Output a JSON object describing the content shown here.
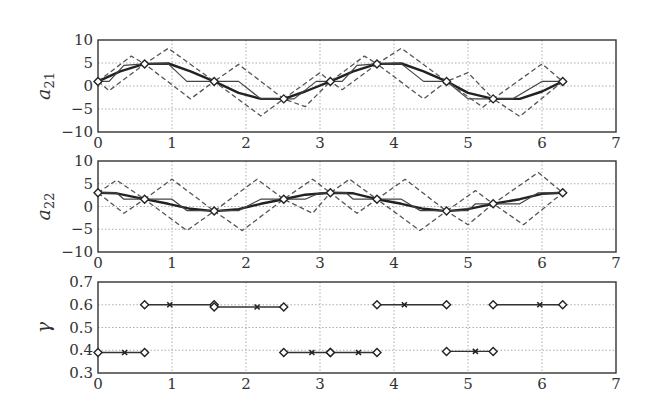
{
  "chart_data": [
    {
      "type": "line",
      "panel": "top",
      "ylabel": "a_21",
      "ylabel_main": "a",
      "ylabel_sub": "21",
      "xlim": [
        0,
        7
      ],
      "ylim": [
        -10,
        10
      ],
      "xticks": [
        "0",
        "1",
        "2",
        "3",
        "4",
        "5",
        "6",
        "7"
      ],
      "yticks": [
        "10",
        "5",
        "0",
        "−5",
        "−10"
      ],
      "grid": true,
      "series": [
        {
          "name": "smooth (thick)",
          "style": "solid-thick",
          "x": [
            0,
            0.3,
            0.63,
            0.95,
            1.25,
            1.57,
            1.9,
            2.2,
            2.51,
            2.8,
            3.14,
            3.45,
            3.77,
            4.1,
            4.4,
            4.71,
            5.0,
            5.34,
            5.7,
            6.0,
            6.28
          ],
          "y": [
            1,
            3.2,
            4.8,
            4.9,
            3.2,
            1,
            -1.5,
            -2.8,
            -2.8,
            -1.2,
            1,
            3.2,
            4.8,
            4.9,
            3.2,
            1,
            -1.5,
            -2.8,
            -2.8,
            -1.2,
            1
          ]
        },
        {
          "name": "piecewise (thin)",
          "style": "solid-thin",
          "x": [
            0,
            0.15,
            0.35,
            0.63,
            0.95,
            1.2,
            1.57,
            1.9,
            2.2,
            2.51,
            2.65,
            2.95,
            3.14,
            3.3,
            3.5,
            3.77,
            4.1,
            4.4,
            4.71,
            5.0,
            5.2,
            5.34,
            5.6,
            6.0,
            6.28
          ],
          "y": [
            1,
            1,
            4.5,
            4.8,
            4.8,
            1,
            1,
            1,
            -2.8,
            -2.8,
            -2.8,
            1,
            1,
            1,
            4.5,
            4.8,
            4.8,
            1,
            1,
            -2.8,
            -2.8,
            -2.8,
            -2.8,
            1,
            1
          ]
        },
        {
          "name": "upper bound (dashed)",
          "style": "dashed",
          "x": [
            0,
            0.45,
            0.63,
            0.95,
            1.57,
            1.9,
            2.51,
            2.8,
            3.14,
            3.6,
            3.77,
            4.1,
            4.71,
            5.0,
            5.34,
            6.0,
            6.28
          ],
          "y": [
            1,
            6.5,
            4.8,
            8.2,
            1,
            4.7,
            -2.8,
            -4.5,
            1,
            6.5,
            4.8,
            8.2,
            1,
            2.9,
            -2.8,
            4.8,
            1
          ]
        },
        {
          "name": "lower bound (dashed)",
          "style": "dashed",
          "x": [
            0,
            0.15,
            0.63,
            1.25,
            1.57,
            2.2,
            2.51,
            3.0,
            3.14,
            3.3,
            3.77,
            4.4,
            4.71,
            5.2,
            5.34,
            5.7,
            6.28
          ],
          "y": [
            1,
            -1,
            4.8,
            -2.8,
            1,
            -6.5,
            -2.8,
            2.9,
            1,
            -0.8,
            4.8,
            -2.8,
            1,
            -4.6,
            -2.8,
            -6.6,
            1
          ]
        }
      ],
      "markers": {
        "shape": "diamond",
        "x": [
          0,
          0.63,
          1.57,
          2.51,
          3.14,
          3.77,
          4.71,
          5.34,
          6.28
        ],
        "y": [
          1,
          4.8,
          1,
          -2.8,
          1,
          4.8,
          1,
          -2.8,
          1
        ]
      }
    },
    {
      "type": "line",
      "panel": "middle",
      "ylabel": "a_22",
      "ylabel_main": "a",
      "ylabel_sub": "22",
      "xlim": [
        0,
        7
      ],
      "ylim": [
        -10,
        10
      ],
      "xticks": [
        "0",
        "1",
        "2",
        "3",
        "4",
        "5",
        "6",
        "7"
      ],
      "yticks": [
        "10",
        "5",
        "0",
        "−5",
        "−10"
      ],
      "grid": true,
      "series": [
        {
          "name": "smooth (thick)",
          "style": "solid-thick",
          "x": [
            0,
            0.25,
            0.63,
            0.95,
            1.25,
            1.57,
            1.9,
            2.2,
            2.51,
            2.8,
            3.14,
            3.45,
            3.77,
            4.1,
            4.4,
            4.71,
            5.0,
            5.34,
            5.7,
            6.0,
            6.28
          ],
          "y": [
            3,
            2.9,
            1.6,
            0.6,
            -0.5,
            -1,
            -0.6,
            0.6,
            1.6,
            2.6,
            3,
            2.9,
            1.6,
            0.6,
            -0.5,
            -1,
            -0.6,
            0.6,
            1.6,
            2.8,
            3
          ]
        },
        {
          "name": "piecewise (thin)",
          "style": "solid-thin",
          "x": [
            0,
            0.25,
            0.35,
            0.63,
            1.0,
            1.2,
            1.57,
            1.9,
            2.2,
            2.51,
            2.8,
            3.0,
            3.14,
            3.35,
            3.45,
            3.77,
            4.1,
            4.35,
            4.71,
            5.0,
            5.1,
            5.34,
            5.7,
            5.95,
            6.28
          ],
          "y": [
            3,
            3,
            1.6,
            1.6,
            1.6,
            -0.9,
            -0.9,
            -0.9,
            1.6,
            1.6,
            1.6,
            3,
            3,
            3,
            1.6,
            1.6,
            1.6,
            -0.9,
            -0.9,
            -0.9,
            0.6,
            0.6,
            0.6,
            3,
            3
          ]
        },
        {
          "name": "upper bound (dashed)",
          "style": "dashed",
          "x": [
            0,
            0.25,
            0.63,
            1.0,
            1.57,
            2.15,
            2.51,
            2.9,
            3.14,
            3.4,
            3.77,
            4.15,
            4.71,
            5.1,
            5.34,
            5.95,
            6.28
          ],
          "y": [
            3,
            5.8,
            1.6,
            6,
            -1,
            6,
            1.6,
            6,
            3,
            6,
            1.6,
            6,
            -1,
            3.5,
            0.6,
            7.5,
            3
          ]
        },
        {
          "name": "lower bound (dashed)",
          "style": "dashed",
          "x": [
            0,
            0.35,
            0.63,
            1.2,
            1.57,
            1.95,
            2.51,
            2.9,
            3.14,
            3.5,
            3.77,
            4.35,
            4.71,
            5.0,
            5.34,
            5.75,
            6.28
          ],
          "y": [
            3,
            -1.5,
            1.6,
            -5.3,
            -1,
            -5.3,
            1.6,
            -1.5,
            3,
            -1.5,
            1.6,
            -5.3,
            -1,
            -4,
            0.6,
            -4,
            3
          ]
        }
      ],
      "markers": {
        "shape": "diamond",
        "x": [
          0,
          0.63,
          1.57,
          2.51,
          3.14,
          3.77,
          4.71,
          5.34,
          6.28
        ],
        "y": [
          3,
          1.6,
          -1,
          1.6,
          3,
          1.6,
          -1,
          0.6,
          3
        ]
      }
    },
    {
      "type": "line",
      "panel": "bottom",
      "ylabel": "γ",
      "ylabel_main": "γ",
      "ylabel_sub": "",
      "xlim": [
        0,
        7
      ],
      "ylim": [
        0.3,
        0.7
      ],
      "xticks": [
        "0",
        "1",
        "2",
        "3",
        "4",
        "5",
        "6",
        "7"
      ],
      "yticks": [
        "0.7",
        "0.6",
        "0.5",
        "0.4",
        "0.3"
      ],
      "grid": true,
      "segments": [
        {
          "x0": 0,
          "x1": 0.63,
          "y": 0.39,
          "xmark": 0.36
        },
        {
          "x0": 0.63,
          "x1": 1.57,
          "y": 0.6,
          "xmark": 0.97
        },
        {
          "x0": 1.57,
          "x1": 2.51,
          "y": 0.59,
          "xmark": 2.15
        },
        {
          "x0": 2.51,
          "x1": 3.14,
          "y": 0.39,
          "xmark": 2.89
        },
        {
          "x0": 3.14,
          "x1": 3.77,
          "y": 0.39,
          "xmark": 3.52
        },
        {
          "x0": 3.77,
          "x1": 4.71,
          "y": 0.6,
          "xmark": 4.14
        },
        {
          "x0": 4.71,
          "x1": 5.34,
          "y": 0.395,
          "xmark": 5.1
        },
        {
          "x0": 5.34,
          "x1": 6.28,
          "y": 0.6,
          "xmark": 5.97
        }
      ]
    }
  ]
}
